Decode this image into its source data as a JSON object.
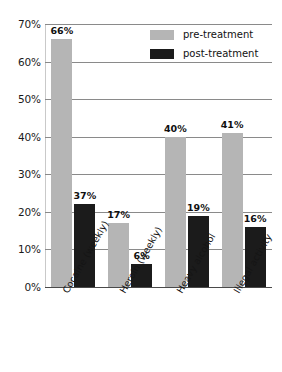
{
  "chart_data": {
    "type": "bar",
    "title": "",
    "subtitle": "",
    "xlabel": "",
    "ylabel": "",
    "ylim": [
      0,
      70
    ],
    "ytick_labels": [
      "70%",
      "60%",
      "50%",
      "40%",
      "30%",
      "20%",
      "10%",
      "0%"
    ],
    "ytick_values": [
      70,
      60,
      50,
      40,
      30,
      20,
      10,
      0
    ],
    "grid": true,
    "legend_position": "top-right-inside",
    "categories": [
      "Cocaine (weekly)",
      "Heroin (weekly)",
      "Heavy alcohol",
      "Illegal activity"
    ],
    "series": [
      {
        "name": "pre-treatment",
        "color": "#b5b5b5",
        "values": [
          66,
          17,
          40,
          41
        ],
        "drawn_values": [
          66,
          17,
          40,
          41
        ],
        "data_labels": [
          "66%",
          "17%",
          "40%",
          "41%"
        ]
      },
      {
        "name": "post-treatment",
        "color": "#1b1b1b",
        "values": [
          37,
          6,
          19,
          16
        ],
        "drawn_values": [
          22,
          6,
          19,
          16
        ],
        "data_labels": [
          "37%",
          "6%",
          "19%",
          "16%"
        ]
      }
    ]
  },
  "legend": {
    "items": [
      {
        "label": "pre-treatment",
        "color": "#b5b5b5"
      },
      {
        "label": "post-treatment",
        "color": "#1b1b1b"
      }
    ]
  },
  "colors": {
    "pre_treatment": "#b5b5b5",
    "post_treatment": "#1b1b1b",
    "gridline": "#8a8a8a",
    "baseline": "#4a4a4a",
    "background": "#ffffff",
    "text": "#111111"
  }
}
